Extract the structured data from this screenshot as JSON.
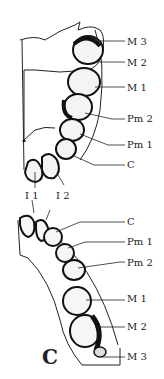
{
  "figure": {
    "panel_label": "C",
    "upper_jaw": {
      "labels": [
        "M 3",
        "M 2",
        "M 1",
        "Pm 2",
        "Pm 1",
        "C",
        "I 1",
        "I 2"
      ]
    },
    "lower_jaw": {
      "labels": [
        "C",
        "Pm 1",
        "Pm 2",
        "M 1",
        "M 2",
        "M 3"
      ]
    },
    "colors": {
      "line": "#222222",
      "background": "#ffffff"
    }
  }
}
